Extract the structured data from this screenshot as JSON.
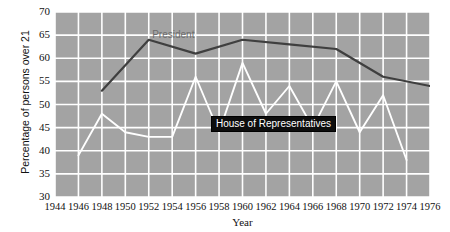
{
  "chart_data": {
    "type": "line",
    "title": "",
    "xlabel": "Year",
    "ylabel": "Percentage of persons over 21",
    "xlim": [
      1944,
      1976
    ],
    "ylim": [
      30,
      70
    ],
    "xticks": [
      1944,
      1946,
      1948,
      1950,
      1952,
      1954,
      1956,
      1958,
      1960,
      1962,
      1964,
      1966,
      1968,
      1970,
      1972,
      1974,
      1976
    ],
    "yticks": [
      30,
      35,
      40,
      45,
      50,
      55,
      60,
      65,
      70
    ],
    "grid": true,
    "legend_position": "inline-annotations",
    "plot_background": "#a3a3a3",
    "gridline_color": "#ffffff",
    "series": [
      {
        "name": "President",
        "color": "#3f3f3f",
        "label_color": "#6d6d6d",
        "x": [
          1948,
          1952,
          1956,
          1960,
          1964,
          1968,
          1972,
          1976
        ],
        "values": [
          53,
          64,
          61,
          64,
          63,
          62,
          56,
          54
        ]
      },
      {
        "name": "House of Representatives",
        "color": "#ffffff",
        "label_color": "#ffffff",
        "label_background": "#0d0d0d",
        "x": [
          1946,
          1948,
          1950,
          1952,
          1954,
          1956,
          1958,
          1960,
          1962,
          1964,
          1966,
          1968,
          1970,
          1972,
          1974
        ],
        "values": [
          39,
          48,
          44,
          43,
          43,
          56,
          44,
          59,
          48,
          54,
          45,
          55,
          44,
          52,
          38
        ]
      }
    ],
    "annotations": [
      {
        "text": "President",
        "x": 1954,
        "y": 65
      },
      {
        "text": "House of Representatives",
        "x": 1962,
        "y": 46
      }
    ]
  }
}
